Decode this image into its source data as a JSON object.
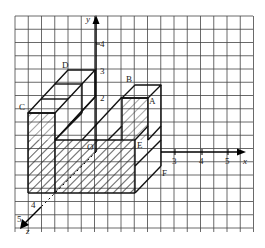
{
  "diagram": {
    "type": "isometric-3d-coordinate-grid",
    "axes": {
      "x": {
        "label": "x",
        "ticks": [
          "3",
          "4",
          "5"
        ]
      },
      "y": {
        "label": "y",
        "ticks": [
          "2",
          "3",
          "4"
        ]
      },
      "z": {
        "label": "z",
        "ticks": [
          "4",
          "5"
        ]
      }
    },
    "origin_label": "O",
    "points": {
      "A": "A",
      "B": "B",
      "C": "C",
      "D": "D",
      "E": "E",
      "F": "F"
    },
    "colors": {
      "grid": "#333333",
      "outline": "#111111",
      "hatch": "#333333",
      "background": "#ffffff"
    }
  }
}
